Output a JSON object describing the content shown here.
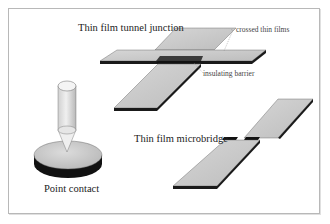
{
  "diagram": {
    "colors": {
      "film_fill": "#c8c8c8",
      "film_edge": "#1a1a1a",
      "barrier": "#111111",
      "frame": "#b8b8b8",
      "leader": "#888888"
    },
    "panels": [
      {
        "id": "tunnel-junction",
        "label": "Thin film tunnel junction",
        "annotations": [
          {
            "id": "crossed",
            "text": "crossed thin films"
          },
          {
            "id": "barrier",
            "text": "insulating barrier"
          }
        ]
      },
      {
        "id": "microbridge",
        "label": "Thin film microbridge"
      },
      {
        "id": "point-contact",
        "label": "Point contact"
      }
    ]
  }
}
